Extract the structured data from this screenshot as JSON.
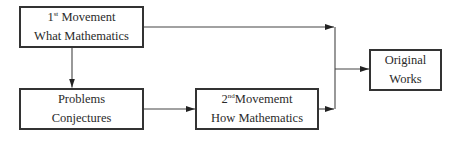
{
  "diagram": {
    "type": "flowchart",
    "nodes": [
      {
        "id": "first-movement",
        "line1_num": "1",
        "line1_sup": "st",
        "line1_text": " Movement",
        "line2": "What Mathematics"
      },
      {
        "id": "problems-conjectures",
        "line1": "Problems",
        "line2": "Conjectures"
      },
      {
        "id": "second-movement",
        "line1_num": "2",
        "line1_sup": "nd",
        "line1_text": "Movememt",
        "line2": "How Mathematics"
      },
      {
        "id": "original-works",
        "line1": "Original",
        "line2": "Works"
      }
    ],
    "edges": [
      {
        "from": "first-movement",
        "to": "problems-conjectures"
      },
      {
        "from": "first-movement",
        "to": "original-works"
      },
      {
        "from": "problems-conjectures",
        "to": "second-movement"
      },
      {
        "from": "second-movement",
        "to": "original-works"
      }
    ],
    "colors": {
      "stroke": "#333333",
      "text": "#2a2a2a",
      "background": "#ffffff"
    }
  }
}
